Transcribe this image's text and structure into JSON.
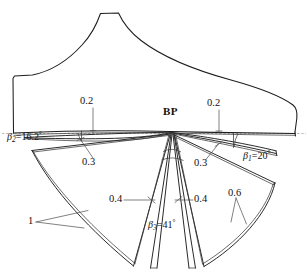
{
  "figure": {
    "name": "branch-point-blade-geometry",
    "background_color": "#ffffff",
    "line_color": "#1d1d1d",
    "reference_line_color": "#8c8c8c",
    "width": 308,
    "height": 279
  },
  "labels": {
    "branch_point": "BP",
    "thickness_top_left": "0.2",
    "thickness_top_right": "0.2",
    "thickness_mid_left": "0.3",
    "thickness_mid_right": "0.3",
    "thickness_inner_left": "0.4",
    "thickness_inner_right": "0.4",
    "thickness_outer_right": "0.6",
    "chord_left": "1"
  },
  "angles": {
    "beta1": {
      "symbol": "β",
      "subscript": "1",
      "equals": "=",
      "value": "20",
      "degree": "°",
      "full": "β₁=20°"
    },
    "beta2": {
      "symbol": "β",
      "subscript": "2",
      "equals": "=",
      "value": "16.2",
      "degree": "°",
      "full": "β₂=16.2°"
    },
    "beta3": {
      "symbol": "β",
      "subscript": "3",
      "equals": "=",
      "value": "41",
      "degree": "°",
      "full": "β₃=41°"
    }
  }
}
